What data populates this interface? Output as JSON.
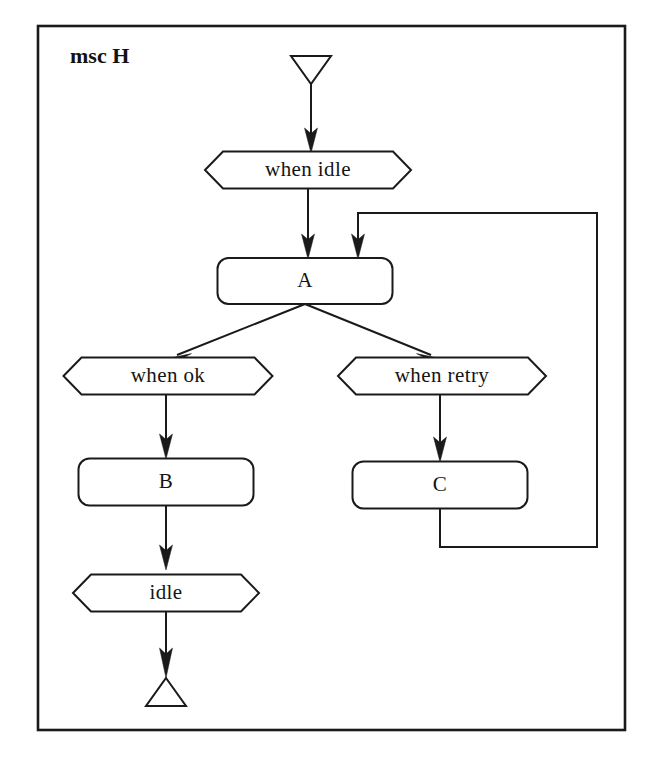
{
  "canvas": {
    "width": 656,
    "height": 763,
    "background": "#ffffff"
  },
  "frame": {
    "title": "msc H",
    "stroke": "#1a1a1a",
    "x": 38,
    "y": 26,
    "width": 587,
    "height": 704
  },
  "caption": {
    "text": ""
  },
  "colors": {
    "stroke": "#1a1a1a",
    "text": "#141414",
    "fill": "#ffffff"
  },
  "nodes": [
    {
      "id": "start",
      "kind": "start-terminal",
      "shape": "triangle-down",
      "label": "",
      "cx": 311,
      "cy": 70,
      "width": 40,
      "height": 28
    },
    {
      "id": "cond-when-idle",
      "kind": "condition",
      "shape": "hexagon",
      "label": "when idle",
      "cx": 308,
      "cy": 170,
      "width": 206,
      "height": 37
    },
    {
      "id": "ref-a",
      "kind": "reference-box",
      "shape": "rounded-rect",
      "label": "A",
      "cx": 305,
      "cy": 281,
      "width": 175,
      "height": 46
    },
    {
      "id": "cond-when-ok",
      "kind": "condition",
      "shape": "hexagon",
      "label": "when ok",
      "cx": 168,
      "cy": 376,
      "width": 209,
      "height": 37
    },
    {
      "id": "cond-when-retry",
      "kind": "condition",
      "shape": "hexagon",
      "label": "when retry",
      "cx": 442,
      "cy": 376,
      "width": 208,
      "height": 37
    },
    {
      "id": "ref-b",
      "kind": "reference-box",
      "shape": "rounded-rect",
      "label": "B",
      "cx": 166,
      "cy": 482,
      "width": 175,
      "height": 47
    },
    {
      "id": "ref-c",
      "kind": "reference-box",
      "shape": "rounded-rect",
      "label": "C",
      "cx": 440,
      "cy": 485,
      "width": 175,
      "height": 47
    },
    {
      "id": "cond-idle",
      "kind": "condition",
      "shape": "hexagon",
      "label": "idle",
      "cx": 166,
      "cy": 593,
      "width": 186,
      "height": 37
    },
    {
      "id": "end",
      "kind": "end-terminal",
      "shape": "triangle-up",
      "label": "",
      "cx": 166,
      "cy": 692,
      "width": 40,
      "height": 28
    }
  ],
  "edges": [
    {
      "id": "e-start-whenidle",
      "from": "start",
      "to": "cond-when-idle",
      "style": "straight-vertical",
      "arrow": true
    },
    {
      "id": "e-whenidle-a",
      "from": "cond-when-idle",
      "to": "ref-a",
      "style": "straight-vertical",
      "arrow": true
    },
    {
      "id": "e-a-whenok",
      "from": "ref-a",
      "to": "cond-when-ok",
      "style": "diagonal-left",
      "arrow": true
    },
    {
      "id": "e-a-whenretry",
      "from": "ref-a",
      "to": "cond-when-retry",
      "style": "diagonal-right",
      "arrow": true
    },
    {
      "id": "e-whenok-b",
      "from": "cond-when-ok",
      "to": "ref-b",
      "style": "straight-vertical",
      "arrow": true
    },
    {
      "id": "e-whenretry-c",
      "from": "cond-when-retry",
      "to": "ref-c",
      "style": "straight-vertical",
      "arrow": true
    },
    {
      "id": "e-b-idle",
      "from": "ref-b",
      "to": "cond-idle",
      "style": "straight-vertical",
      "arrow": true
    },
    {
      "id": "e-idle-end",
      "from": "cond-idle",
      "to": "end",
      "style": "straight-vertical",
      "arrow": true
    },
    {
      "id": "e-c-a-loopback",
      "from": "ref-c",
      "to": "ref-a",
      "style": "orthogonal-loop",
      "arrow": true
    }
  ]
}
